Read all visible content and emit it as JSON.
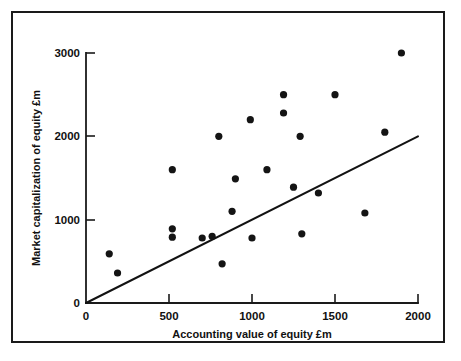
{
  "chart_data": {
    "type": "scatter",
    "title": "",
    "xlabel": "Accounting value of equity £m",
    "ylabel": "Market capitalization of equity £m",
    "xlim": [
      0,
      2000
    ],
    "ylim": [
      0,
      3000
    ],
    "xticks": [
      0,
      500,
      1000,
      1500,
      2000
    ],
    "yticks": [
      0,
      1000,
      2000,
      3000
    ],
    "xticklabels": [
      "0",
      "500",
      "1000",
      "1500",
      "2000"
    ],
    "yticklabels": [
      "0",
      "1000",
      "2000",
      "3000"
    ],
    "grid": false,
    "legend": null,
    "series": [
      {
        "name": "Companies",
        "marker": "filled-circle",
        "color": "#141414",
        "points": [
          {
            "x": 140,
            "y": 590
          },
          {
            "x": 190,
            "y": 360
          },
          {
            "x": 520,
            "y": 1600
          },
          {
            "x": 520,
            "y": 890
          },
          {
            "x": 520,
            "y": 790
          },
          {
            "x": 700,
            "y": 780
          },
          {
            "x": 760,
            "y": 800
          },
          {
            "x": 820,
            "y": 470
          },
          {
            "x": 800,
            "y": 2000
          },
          {
            "x": 880,
            "y": 1100
          },
          {
            "x": 900,
            "y": 1490
          },
          {
            "x": 990,
            "y": 2200
          },
          {
            "x": 1000,
            "y": 780
          },
          {
            "x": 1090,
            "y": 1600
          },
          {
            "x": 1190,
            "y": 2500
          },
          {
            "x": 1190,
            "y": 2280
          },
          {
            "x": 1250,
            "y": 1390
          },
          {
            "x": 1290,
            "y": 2000
          },
          {
            "x": 1300,
            "y": 830
          },
          {
            "x": 1400,
            "y": 1320
          },
          {
            "x": 1500,
            "y": 2500
          },
          {
            "x": 1680,
            "y": 1080
          },
          {
            "x": 1800,
            "y": 2050
          },
          {
            "x": 1900,
            "y": 3000
          }
        ]
      }
    ],
    "fit_line": {
      "name": "Fitted line",
      "color": "#121212",
      "from": {
        "x": 0,
        "y": 0
      },
      "to": {
        "x": 2000,
        "y": 2000
      }
    }
  },
  "axes": {
    "x_axis_title": "Accounting value of equity £m",
    "y_axis_title": "Market capitalization of equity £m",
    "x_tick_labels": [
      "0",
      "500",
      "1000",
      "1500",
      "2000"
    ],
    "y_tick_labels": [
      "0",
      "1000",
      "2000",
      "3000"
    ]
  },
  "colors": {
    "frame": "#1a1a1a",
    "axis": "#1a1a1a",
    "marker": "#141414",
    "line": "#121212",
    "background": "#ffffff"
  }
}
